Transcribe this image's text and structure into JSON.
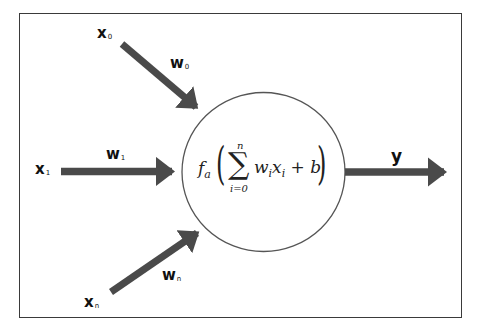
{
  "diagram": {
    "inputs": [
      {
        "label": "x",
        "subscript": "0"
      },
      {
        "label": "x",
        "subscript": "1"
      },
      {
        "label": "x",
        "subscript": "n"
      }
    ],
    "weights": [
      {
        "label": "w",
        "subscript": "0"
      },
      {
        "label": "w",
        "subscript": "1"
      },
      {
        "label": "w",
        "subscript": "n"
      }
    ],
    "neuron": {
      "function": "f",
      "function_subscript": "a",
      "sum_symbol": "∑",
      "sum_upper": "n",
      "sum_lower": "i=0",
      "term_w": "w",
      "term_w_sub": "i",
      "term_x": "x",
      "term_x_sub": "i",
      "bias_part": " + b",
      "open_paren": "(",
      "close_paren": ")"
    },
    "output": {
      "label": "y"
    },
    "colors": {
      "arrow": "#4a4a4a",
      "circle_stroke": "#555555",
      "frame": "#3a3a3a",
      "text": "#111111"
    }
  }
}
